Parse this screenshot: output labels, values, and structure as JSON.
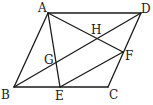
{
  "diagram": {
    "type": "geometry",
    "points": {
      "A": {
        "label": "A",
        "x": 48,
        "y": 13
      },
      "D": {
        "label": "D",
        "x": 141,
        "y": 13
      },
      "B": {
        "label": "B",
        "x": 14,
        "y": 87
      },
      "C": {
        "label": "C",
        "x": 108,
        "y": 87
      },
      "E": {
        "label": "E",
        "x": 60,
        "y": 87
      },
      "F": {
        "label": "F",
        "x": 123,
        "y": 52
      },
      "G": {
        "label": "G",
        "x": 55,
        "y": 62
      },
      "H": {
        "label": "H",
        "x": 96,
        "y": 37
      }
    },
    "segments": [
      "AB",
      "AD",
      "DC",
      "BC",
      "AE",
      "AF",
      "BD",
      "EF"
    ],
    "labels": {
      "A": "A",
      "B": "B",
      "C": "C",
      "D": "D",
      "E": "E",
      "F": "F",
      "G": "G",
      "H": "H"
    }
  }
}
